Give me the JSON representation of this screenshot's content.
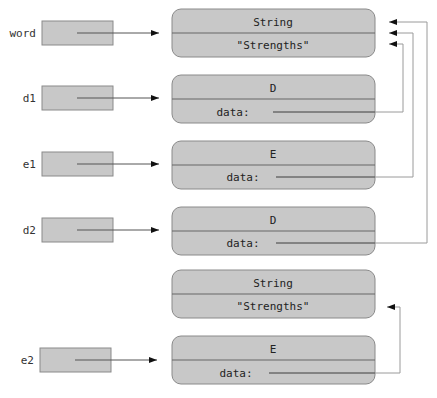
{
  "diagram": {
    "type": "object-reference-diagram",
    "colors": {
      "box_fill": "#c8c8c8",
      "box_stroke": "#8a8a8a",
      "line": "#555555",
      "connector": "#9a9a9a",
      "arrowhead": "#111111"
    },
    "variables": [
      {
        "name": "word",
        "y": 33
      },
      {
        "name": "d1",
        "y": 98
      },
      {
        "name": "e1",
        "y": 164
      },
      {
        "name": "d2",
        "y": 230
      },
      {
        "name": "e2",
        "y": 360
      }
    ],
    "objects": [
      {
        "id": "obj1",
        "type": "String",
        "field": "\"Strengths\"",
        "y": 9
      },
      {
        "id": "obj2",
        "type": "D",
        "field": "data:",
        "y": 75
      },
      {
        "id": "obj3",
        "type": "E",
        "field": "data:",
        "y": 141
      },
      {
        "id": "obj4",
        "type": "D",
        "field": "data:",
        "y": 207
      },
      {
        "id": "obj5",
        "type": "String",
        "field": "\"Strengths\"",
        "y": 270
      },
      {
        "id": "obj6",
        "type": "E",
        "field": "data:",
        "y": 336
      }
    ],
    "references": [
      {
        "from": "word",
        "to": "obj1"
      },
      {
        "from": "d1",
        "to": "obj2"
      },
      {
        "from": "e1",
        "to": "obj3"
      },
      {
        "from": "d2",
        "to": "obj4"
      },
      {
        "from": "e2",
        "to": "obj6"
      },
      {
        "from": "obj2.data",
        "to": "obj1"
      },
      {
        "from": "obj3.data",
        "to": "obj1"
      },
      {
        "from": "obj4.data",
        "to": "obj1"
      },
      {
        "from": "obj6.data",
        "to": "obj5"
      }
    ]
  }
}
